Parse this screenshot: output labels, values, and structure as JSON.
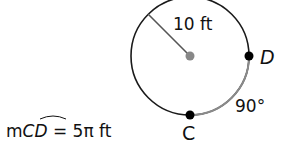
{
  "diagram": {
    "radius_label": "10 ft",
    "point_d": "D",
    "point_c": "C",
    "angle_label": "90°",
    "arc_measure": {
      "prefix": "m",
      "arc": "CD",
      "equals": "= 5π ft"
    },
    "colors": {
      "circle": "#1a1a1a",
      "arc": "#8a8a8a",
      "center": "#888888",
      "radius": "#555555"
    }
  }
}
